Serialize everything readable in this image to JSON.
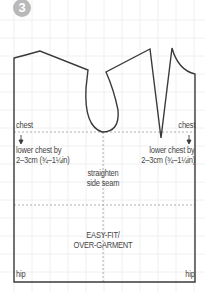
{
  "step": {
    "number": "3"
  },
  "colors": {
    "outline": "#3a3a3a",
    "guide": "#9a9a9a",
    "grid": "#f0f0f0",
    "badge": "#b9b9b9",
    "text": "#444444"
  },
  "labels": {
    "chest_left": "chest",
    "chest_right": "chest",
    "arrow_left": "↓",
    "arrow_right": "↓",
    "lower_left_1": "lower chest by",
    "lower_left_2": "2–3cm (¾–1¼in)",
    "lower_right_1": "lower chest by",
    "lower_right_2": "2–3cm (¾–1¼in)",
    "straighten_1": "straighten",
    "straighten_2": "side seam",
    "easy_1": "EASY-FIT/",
    "easy_2": "OVER-GARMENT",
    "hip_left": "hip",
    "hip_right": "hip"
  }
}
